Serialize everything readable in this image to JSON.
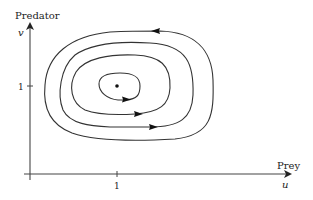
{
  "diagram": {
    "type": "phase-portrait",
    "y_axis": {
      "label": "Predator",
      "variable": "v",
      "tick_label": "1"
    },
    "x_axis": {
      "label": "Prey",
      "variable": "u",
      "tick_label": "1"
    },
    "equilibrium": {
      "u": 1,
      "v": 1
    },
    "orbits": [
      {
        "name": "outer",
        "direction": "counterclockwise"
      },
      {
        "name": "second",
        "direction": "counterclockwise"
      },
      {
        "name": "third",
        "direction": "counterclockwise"
      },
      {
        "name": "inner",
        "direction": "counterclockwise"
      }
    ],
    "colors": {
      "stroke": "#333333",
      "axis": "#444444"
    }
  }
}
